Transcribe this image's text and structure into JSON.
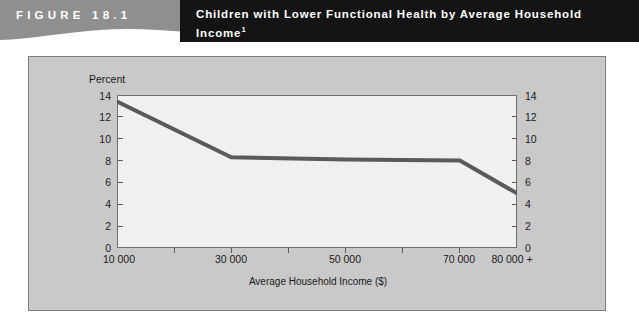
{
  "figure": {
    "label": "FIGURE 18.1",
    "title": "Children with Lower Functional Health by Average Household",
    "title_line2": "Income",
    "title_footnote": "1"
  },
  "colors": {
    "band_gray": "#8f8f8f",
    "title_bar": "#141414",
    "panel_gray": "#c9c9c9",
    "plot_bg": "#f0f0f0",
    "series": "#5a5a5a",
    "axis": "#6f6f6f"
  },
  "chart_data": {
    "type": "line",
    "title": "Children with Lower Functional Health by Average Household Income",
    "xlabel": "Average Household Income ($)",
    "ylabel": "Percent",
    "y_axis_title": "Percent",
    "xlim": [
      10000,
      80000
    ],
    "ylim": [
      0,
      14
    ],
    "grid": false,
    "legend": "none",
    "y_ticks": [
      0,
      2,
      4,
      6,
      8,
      10,
      12,
      14
    ],
    "y_tick_labels": [
      "0",
      "2",
      "4",
      "6",
      "8",
      "10",
      "12",
      "14"
    ],
    "y_axis_right_mirrored": true,
    "x_ticks": [
      10000,
      20000,
      30000,
      40000,
      50000,
      60000,
      70000,
      80000
    ],
    "x_tick_labels": [
      "10 000",
      "",
      "30 000",
      "",
      "50 000",
      "",
      "70 000",
      "80 000 +"
    ],
    "series": [
      {
        "name": "Children with lower functional health",
        "x": [
          10000,
          30000,
          50000,
          70000,
          80000
        ],
        "values": [
          13.4,
          8.3,
          8.1,
          8.0,
          5.0
        ]
      }
    ]
  }
}
